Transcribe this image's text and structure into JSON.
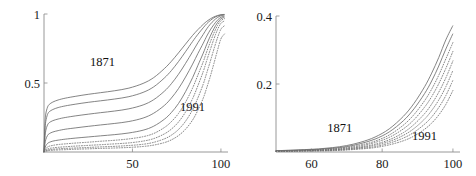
{
  "chart_data": [
    {
      "panel": "left",
      "type": "line",
      "title": "",
      "xlabel": "",
      "ylabel": "",
      "xlim": [
        0,
        104
      ],
      "ylim": [
        0,
        1.0
      ],
      "xticks": [
        50,
        100
      ],
      "xticklabels": [
        "50",
        "100"
      ],
      "yticks": [
        0.5,
        1
      ],
      "yticklabels": [
        "0.5",
        "1"
      ],
      "grid": false,
      "legend_position": "inline-annotations",
      "annotations": [
        {
          "text": "1871",
          "x": 33,
          "y": 0.62
        },
        {
          "text": "1991",
          "x": 84,
          "y": 0.3
        }
      ],
      "x": [
        0,
        0.5,
        1,
        2,
        3,
        5,
        8,
        12,
        18,
        25,
        32,
        40,
        48,
        56,
        62,
        68,
        72,
        76,
        80,
        84,
        87,
        90,
        92,
        94,
        96,
        98,
        100,
        102
      ],
      "series": [
        {
          "name": "1871",
          "style": "solid",
          "values": [
            0.0,
            0.195,
            0.275,
            0.325,
            0.345,
            0.362,
            0.377,
            0.39,
            0.404,
            0.418,
            0.43,
            0.444,
            0.463,
            0.497,
            0.539,
            0.604,
            0.657,
            0.718,
            0.782,
            0.845,
            0.887,
            0.925,
            0.947,
            0.965,
            0.979,
            0.989,
            0.995,
            0.997
          ]
        },
        {
          "name": "1891",
          "style": "solid",
          "values": [
            0.0,
            0.15,
            0.222,
            0.272,
            0.292,
            0.308,
            0.322,
            0.334,
            0.347,
            0.36,
            0.371,
            0.384,
            0.401,
            0.432,
            0.472,
            0.536,
            0.59,
            0.655,
            0.727,
            0.801,
            0.853,
            0.9,
            0.93,
            0.953,
            0.972,
            0.985,
            0.993,
            0.996
          ]
        },
        {
          "name": "1911",
          "style": "solid",
          "values": [
            0.0,
            0.1,
            0.155,
            0.196,
            0.213,
            0.227,
            0.239,
            0.25,
            0.262,
            0.274,
            0.285,
            0.297,
            0.313,
            0.341,
            0.379,
            0.44,
            0.495,
            0.563,
            0.642,
            0.727,
            0.792,
            0.852,
            0.893,
            0.926,
            0.953,
            0.974,
            0.987,
            0.992
          ]
        },
        {
          "name": "1931",
          "style": "solid",
          "values": [
            0.0,
            0.055,
            0.09,
            0.12,
            0.133,
            0.145,
            0.155,
            0.165,
            0.175,
            0.186,
            0.196,
            0.207,
            0.221,
            0.246,
            0.281,
            0.337,
            0.391,
            0.459,
            0.543,
            0.637,
            0.714,
            0.788,
            0.84,
            0.885,
            0.923,
            0.955,
            0.976,
            0.984
          ]
        },
        {
          "name": "1951",
          "style": "solid",
          "values": [
            0.0,
            0.026,
            0.045,
            0.062,
            0.07,
            0.079,
            0.086,
            0.093,
            0.101,
            0.109,
            0.117,
            0.126,
            0.138,
            0.158,
            0.187,
            0.237,
            0.286,
            0.351,
            0.437,
            0.539,
            0.628,
            0.716,
            0.781,
            0.84,
            0.893,
            0.936,
            0.965,
            0.976
          ]
        },
        {
          "name": "1961",
          "style": "dotted",
          "values": [
            0.0,
            0.014,
            0.025,
            0.036,
            0.042,
            0.048,
            0.054,
            0.059,
            0.065,
            0.071,
            0.078,
            0.085,
            0.095,
            0.111,
            0.134,
            0.177,
            0.22,
            0.279,
            0.361,
            0.464,
            0.558,
            0.654,
            0.728,
            0.797,
            0.861,
            0.915,
            0.952,
            0.966
          ]
        },
        {
          "name": "1971",
          "style": "dotted",
          "values": [
            0.0,
            0.008,
            0.015,
            0.022,
            0.026,
            0.03,
            0.034,
            0.038,
            0.043,
            0.048,
            0.053,
            0.059,
            0.066,
            0.079,
            0.097,
            0.131,
            0.166,
            0.217,
            0.29,
            0.387,
            0.481,
            0.583,
            0.664,
            0.742,
            0.818,
            0.884,
            0.932,
            0.95
          ]
        },
        {
          "name": "1981",
          "style": "dotted",
          "values": [
            0.0,
            0.005,
            0.009,
            0.014,
            0.017,
            0.02,
            0.023,
            0.026,
            0.029,
            0.033,
            0.037,
            0.041,
            0.047,
            0.056,
            0.07,
            0.095,
            0.122,
            0.163,
            0.223,
            0.307,
            0.393,
            0.492,
            0.574,
            0.657,
            0.744,
            0.825,
            0.89,
            0.915
          ]
        },
        {
          "name": "1991",
          "style": "dotted",
          "values": [
            0.0,
            0.003,
            0.006,
            0.009,
            0.011,
            0.013,
            0.015,
            0.017,
            0.02,
            0.023,
            0.026,
            0.029,
            0.033,
            0.04,
            0.05,
            0.068,
            0.088,
            0.119,
            0.165,
            0.232,
            0.303,
            0.39,
            0.466,
            0.548,
            0.64,
            0.734,
            0.82,
            0.855
          ]
        }
      ]
    },
    {
      "panel": "right",
      "type": "line",
      "title": "",
      "xlabel": "",
      "ylabel": "",
      "xlim": [
        50,
        102
      ],
      "ylim": [
        0,
        0.4
      ],
      "xticks": [
        60,
        80,
        100
      ],
      "xticklabels": [
        "60",
        "80",
        "100"
      ],
      "yticks": [
        0.2,
        0.4
      ],
      "yticklabels": [
        "0.2",
        "0.4"
      ],
      "grid": false,
      "legend_position": "inline-annotations",
      "annotations": [
        {
          "text": "1871",
          "x": 68,
          "y": 0.058
        },
        {
          "text": "1991",
          "x": 92,
          "y": 0.035
        }
      ],
      "x": [
        50,
        54,
        58,
        62,
        66,
        70,
        74,
        78,
        82,
        86,
        89,
        92,
        94,
        96,
        98,
        100
      ],
      "series": [
        {
          "name": "1871",
          "style": "solid",
          "values": [
            0.004,
            0.005,
            0.007,
            0.009,
            0.013,
            0.019,
            0.029,
            0.044,
            0.068,
            0.105,
            0.143,
            0.192,
            0.232,
            0.278,
            0.33,
            0.372
          ]
        },
        {
          "name": "1891",
          "style": "solid",
          "values": [
            0.004,
            0.005,
            0.006,
            0.008,
            0.011,
            0.016,
            0.025,
            0.038,
            0.059,
            0.092,
            0.127,
            0.172,
            0.209,
            0.253,
            0.303,
            0.348
          ]
        },
        {
          "name": "1911",
          "style": "dotted",
          "values": [
            0.003,
            0.004,
            0.005,
            0.007,
            0.01,
            0.014,
            0.021,
            0.032,
            0.05,
            0.079,
            0.11,
            0.151,
            0.185,
            0.226,
            0.274,
            0.322
          ]
        },
        {
          "name": "1931",
          "style": "dotted",
          "values": [
            0.003,
            0.004,
            0.005,
            0.006,
            0.008,
            0.012,
            0.018,
            0.028,
            0.043,
            0.068,
            0.095,
            0.132,
            0.163,
            0.201,
            0.246,
            0.296
          ]
        },
        {
          "name": "1951",
          "style": "dotted",
          "values": [
            0.003,
            0.003,
            0.004,
            0.005,
            0.007,
            0.01,
            0.015,
            0.023,
            0.036,
            0.057,
            0.081,
            0.113,
            0.141,
            0.176,
            0.218,
            0.268
          ]
        },
        {
          "name": "1971",
          "style": "dotted",
          "values": [
            0.002,
            0.003,
            0.004,
            0.005,
            0.006,
            0.009,
            0.013,
            0.02,
            0.031,
            0.049,
            0.069,
            0.097,
            0.122,
            0.153,
            0.192,
            0.24
          ]
        },
        {
          "name": "1981",
          "style": "dotted",
          "values": [
            0.002,
            0.003,
            0.003,
            0.004,
            0.005,
            0.007,
            0.011,
            0.016,
            0.026,
            0.041,
            0.058,
            0.082,
            0.103,
            0.131,
            0.166,
            0.211
          ]
        },
        {
          "name": "1991",
          "style": "dotted",
          "values": [
            0.002,
            0.002,
            0.003,
            0.003,
            0.004,
            0.006,
            0.009,
            0.013,
            0.021,
            0.033,
            0.047,
            0.067,
            0.085,
            0.109,
            0.14,
            0.181
          ]
        }
      ]
    }
  ]
}
